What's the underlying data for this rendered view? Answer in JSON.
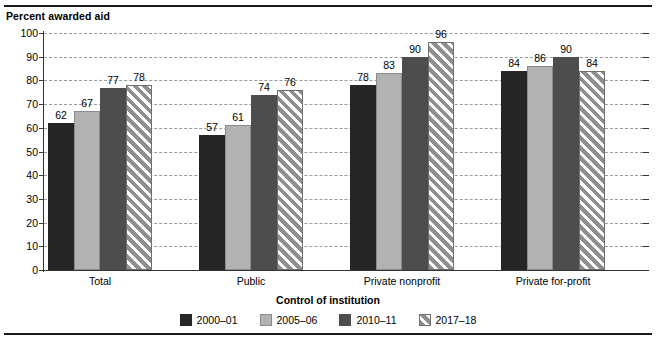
{
  "chart_data": {
    "type": "bar",
    "title": "",
    "ylabel": "Percent awarded aid",
    "xlabel": "Control of institution",
    "ylim": [
      0,
      100
    ],
    "yticks": [
      0,
      10,
      20,
      30,
      40,
      50,
      60,
      70,
      80,
      90,
      100
    ],
    "ytick_labels": [
      "0",
      "10",
      "20",
      "30",
      "40",
      "50",
      "60",
      "70",
      "80",
      "90",
      "100"
    ],
    "grid": true,
    "legend_position": "bottom",
    "categories": [
      "Total",
      "Public",
      "Private nonprofit",
      "Private for-profit"
    ],
    "series": [
      {
        "name": "2000–01",
        "color": "#262626",
        "pattern": "solid",
        "values": [
          62,
          57,
          78,
          84
        ]
      },
      {
        "name": "2005–06",
        "color": "#b2b2b2",
        "pattern": "solid",
        "values": [
          67,
          61,
          83,
          86
        ]
      },
      {
        "name": "2010–11",
        "color": "#4d4d4d",
        "pattern": "solid",
        "values": [
          77,
          74,
          90,
          90
        ]
      },
      {
        "name": "2017–18",
        "color": "#8f8f8f",
        "pattern": "diagonal-hatch",
        "values": [
          78,
          76,
          96,
          84
        ]
      }
    ],
    "value_labels": [
      [
        "62",
        "67",
        "77",
        "78"
      ],
      [
        "57",
        "61",
        "74",
        "76"
      ],
      [
        "78",
        "83",
        "90",
        "96"
      ],
      [
        "84",
        "86",
        "90",
        "84"
      ]
    ]
  }
}
